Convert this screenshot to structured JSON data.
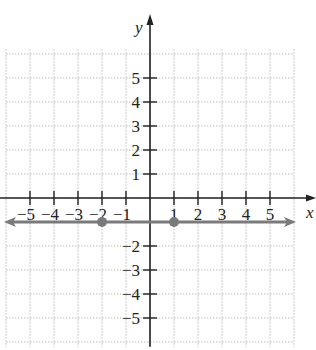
{
  "chart_data": {
    "type": "line",
    "title": "",
    "xlabel": "x",
    "ylabel": "y",
    "xlim": [
      -6,
      6
    ],
    "ylim": [
      -6,
      6
    ],
    "grid": true,
    "x_ticks": [
      "−5",
      "−4",
      "−3",
      "−2",
      "−1",
      "1",
      "2",
      "3",
      "4",
      "5"
    ],
    "y_ticks": [
      "5",
      "4",
      "3",
      "2",
      "1",
      "−2",
      "−3",
      "−4",
      "−5"
    ],
    "series": [
      {
        "name": "horizontal line y = -1",
        "equation": "y = -1",
        "x": [
          -6,
          6
        ],
        "y": [
          -1,
          -1
        ],
        "color": "#7a7a7a",
        "arrows": "both"
      }
    ],
    "points": [
      {
        "x": -2,
        "y": -1,
        "color": "#7a7a7a"
      },
      {
        "x": 1,
        "y": -1,
        "color": "#7a7a7a"
      }
    ]
  }
}
